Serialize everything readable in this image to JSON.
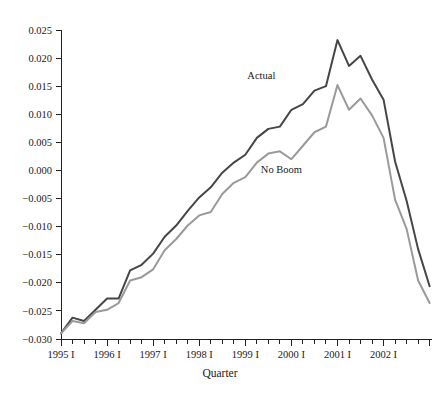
{
  "chart_data": {
    "type": "line",
    "title": "",
    "xlabel": "Quarter",
    "ylabel": "",
    "ylim": [
      -0.03,
      0.025
    ],
    "ytick_values": [
      0.025,
      0.02,
      0.015,
      0.01,
      0.005,
      0.0,
      -0.005,
      -0.01,
      -0.015,
      -0.02,
      -0.025,
      -0.03
    ],
    "ytick_labels": [
      "0.025",
      "0.020",
      "0.015",
      "0.010",
      "0.005",
      "0.000",
      "−0.005",
      "−0.010",
      "−0.015",
      "−0.020",
      "−0.025",
      "−0.030"
    ],
    "xtick_labels": [
      "1995 I",
      "1996 I",
      "1997 I",
      "1998 I",
      "1999 I",
      "2000 I",
      "2001 I",
      "2002 I"
    ],
    "x_quarters": [
      "1995 I",
      "1995 II",
      "1995 III",
      "1995 IV",
      "1996 I",
      "1996 II",
      "1996 III",
      "1996 IV",
      "1997 I",
      "1997 II",
      "1997 III",
      "1997 IV",
      "1998 I",
      "1998 II",
      "1998 III",
      "1998 IV",
      "1999 I",
      "1999 II",
      "1999 III",
      "1999 IV",
      "2000 I",
      "2000 II",
      "2000 III",
      "2000 IV",
      "2001 I",
      "2001 II",
      "2001 III",
      "2001 IV",
      "2002 I",
      "2002 II",
      "2002 III",
      "2002 IV"
    ],
    "grid": false,
    "legend_position": "inline-annotations",
    "series": [
      {
        "name": "Actual",
        "color": "#464646",
        "label_x_quarter": "1999 I",
        "label_value": 0.0155,
        "values": [
          -0.029,
          -0.0262,
          -0.0268,
          -0.0248,
          -0.0228,
          -0.0228,
          -0.0178,
          -0.0168,
          -0.0148,
          -0.0118,
          -0.0098,
          -0.0072,
          -0.0048,
          -0.003,
          -0.0004,
          0.0014,
          0.0028,
          0.0058,
          0.0074,
          0.0078,
          0.0108,
          0.0118,
          0.0142,
          0.015,
          0.0232,
          0.0186,
          0.0204,
          0.0162,
          0.0126,
          0.0016,
          -0.0054,
          -0.014,
          -0.0206
        ]
      },
      {
        "name": "No Boom",
        "color": "#9a9a9a",
        "label_x_quarter": "1999 II",
        "label_value": 0.0002,
        "values": [
          -0.029,
          -0.0268,
          -0.0272,
          -0.0252,
          -0.0248,
          -0.0236,
          -0.0196,
          -0.019,
          -0.0176,
          -0.0142,
          -0.0122,
          -0.0098,
          -0.008,
          -0.0074,
          -0.0042,
          -0.0022,
          -0.0012,
          0.0014,
          0.003,
          0.0034,
          0.002,
          0.0044,
          0.0068,
          0.0078,
          0.0152,
          0.0108,
          0.0128,
          0.0098,
          0.0058,
          -0.0052,
          -0.0104,
          -0.0196,
          -0.0236
        ]
      }
    ]
  },
  "annotations": {
    "actual_label": "Actual",
    "noboom_label": "No Boom"
  },
  "axes": {
    "x_title": "Quarter"
  }
}
